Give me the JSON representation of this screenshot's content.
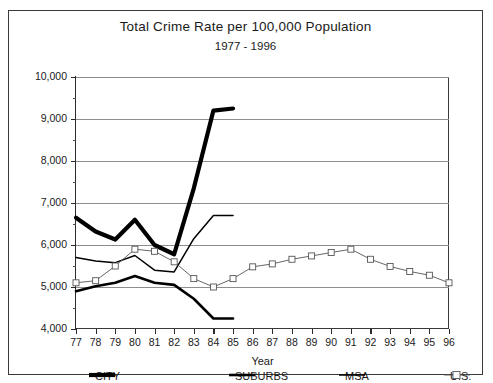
{
  "chart_data": {
    "type": "line",
    "title": "Total Crime Rate per 100,000 Population",
    "subtitle": "1977 - 1996",
    "xlabel": "Year",
    "ylabel": "",
    "xlim": [
      77,
      96
    ],
    "ylim": [
      4000,
      10000
    ],
    "grid": true,
    "legend_position": "bottom",
    "ytick_labels": [
      "10,000",
      "9,000",
      "8,000",
      "7,000",
      "6,000",
      "5,000",
      "4,000"
    ],
    "ytick_values": [
      10000,
      9000,
      8000,
      7000,
      6000,
      5000,
      4000
    ],
    "yminor_values": [
      9500,
      8500,
      7500,
      6500,
      5500,
      4500
    ],
    "categories": [
      "77",
      "78",
      "79",
      "80",
      "81",
      "82",
      "83",
      "84",
      "85",
      "86",
      "87",
      "88",
      "89",
      "90",
      "91",
      "92",
      "93",
      "94",
      "95",
      "96"
    ],
    "series": [
      {
        "name": "CITY",
        "style": "thick-solid",
        "color": "#000000",
        "x": [
          77,
          78,
          79,
          80,
          81,
          82,
          83,
          84,
          85
        ],
        "values": [
          6650,
          6320,
          6130,
          6600,
          6000,
          5780,
          7350,
          9200,
          9250
        ]
      },
      {
        "name": "SUBURBS",
        "style": "medium-solid",
        "color": "#000000",
        "x": [
          77,
          78,
          79,
          80,
          81,
          82,
          83,
          84,
          85
        ],
        "values": [
          4900,
          5020,
          5100,
          5260,
          5100,
          5050,
          4720,
          4250,
          4250
        ]
      },
      {
        "name": "MSA",
        "style": "thin-solid",
        "color": "#000000",
        "x": [
          77,
          78,
          79,
          80,
          81,
          82,
          83,
          84,
          85
        ],
        "values": [
          5700,
          5620,
          5580,
          5750,
          5400,
          5360,
          6150,
          6700,
          6700
        ]
      },
      {
        "name": "U.S.",
        "style": "thin-square-marker",
        "color": "#555555",
        "x": [
          77,
          78,
          79,
          80,
          81,
          82,
          83,
          84,
          85,
          86,
          87,
          88,
          89,
          90,
          91,
          92,
          93,
          94,
          95,
          96
        ],
        "values": [
          5100,
          5150,
          5500,
          5900,
          5850,
          5600,
          5200,
          5000,
          5200,
          5480,
          5550,
          5660,
          5740,
          5820,
          5900,
          5660,
          5490,
          5370,
          5280,
          5100
        ]
      }
    ]
  },
  "legend": {
    "items": [
      {
        "label": "CITY"
      },
      {
        "label": "SUBURBS"
      },
      {
        "label": "MSA"
      },
      {
        "label": "U.S."
      }
    ]
  }
}
